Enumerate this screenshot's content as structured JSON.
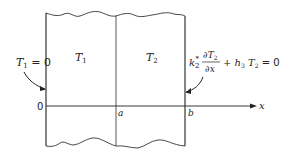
{
  "diagram": {
    "regions": [
      {
        "label": "T",
        "subscript": "1"
      },
      {
        "label": "T",
        "subscript": "2"
      }
    ],
    "left_bc": {
      "var": "T",
      "sub": "1",
      "rest": " = 0"
    },
    "right_bc": {
      "k": "k",
      "k_sub": "2",
      "k_sup": "*",
      "num": "∂T",
      "num_sub": "2",
      "den": "∂x",
      "plus": "+ h",
      "h_sub": "3",
      "T": " T",
      "T_sub": "2",
      "rest": " = 0"
    },
    "axis": {
      "origin": "0",
      "a": "a",
      "b": "b",
      "x": "x"
    }
  }
}
